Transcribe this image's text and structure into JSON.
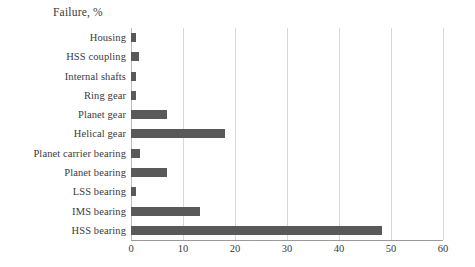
{
  "chart_data": {
    "type": "bar",
    "orientation": "horizontal",
    "title": "Failure, %",
    "xlabel": "",
    "ylabel": "",
    "xlim": [
      0,
      60
    ],
    "xticks": [
      0,
      10,
      20,
      30,
      40,
      50,
      60
    ],
    "grid": true,
    "legend": null,
    "bar_color": "#595959",
    "grid_color": "#d8d8d8",
    "axis_color": "#9a9a9a",
    "categories": [
      "Housing",
      "HSS coupling",
      "Internal shafts",
      "Ring gear",
      "Planet gear",
      "Helical gear",
      "Planet carrier bearing",
      "Planet bearing",
      "LSS bearing",
      "IMS bearing",
      "HSS bearing"
    ],
    "values": [
      1.0,
      1.6,
      1.0,
      1.0,
      7.0,
      18.0,
      1.8,
      7.0,
      1.0,
      13.3,
      48.3
    ]
  }
}
